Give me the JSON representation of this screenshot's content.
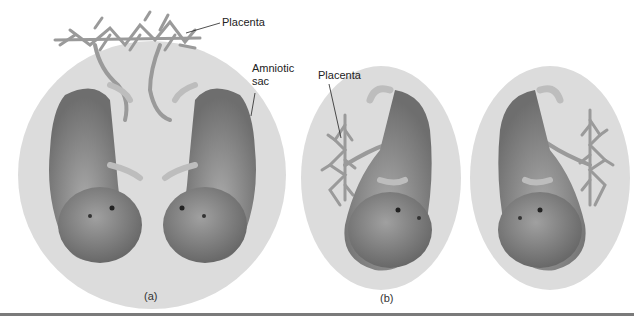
{
  "panel_a": {
    "caption": "(a)",
    "labels": {
      "placenta": "Placenta",
      "amniotic_sac_line1": "Amniotic",
      "amniotic_sac_line2": "sac"
    },
    "description": "Twins sharing one placenta and one amniotic sac"
  },
  "panel_b": {
    "caption": "(b)",
    "labels": {
      "placenta": "Placenta"
    },
    "description": "Twins each with separate placenta and amniotic sac"
  },
  "colors": {
    "sac": "#d9d9d9",
    "fetus_dark": "#7a7a7a",
    "fetus_light": "#b8b8b8",
    "placenta": "#9a9a9a",
    "rule": "#7a7a7a"
  }
}
